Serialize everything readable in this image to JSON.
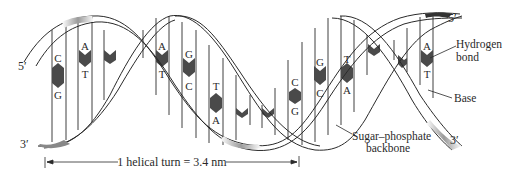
{
  "diagram": {
    "type": "DNA double helix",
    "strand_ends": {
      "top_left": "5′",
      "bottom_left": "3′",
      "top_right": "5′",
      "bottom_right": "3′"
    },
    "base_pairs": [
      {
        "top": "C",
        "bottom": "G",
        "x": 56
      },
      {
        "top": "A",
        "bottom": "T",
        "x": 85
      },
      {
        "top": "A",
        "bottom": "T",
        "x": 162
      },
      {
        "top": "G",
        "bottom": "C",
        "x": 189
      },
      {
        "top": "T",
        "bottom": "A",
        "x": 216
      },
      {
        "top": "C",
        "bottom": "G",
        "x": 295
      },
      {
        "top": "G",
        "bottom": "C",
        "x": 320
      },
      {
        "top": "T",
        "bottom": "A",
        "x": 347
      },
      {
        "top": "A",
        "bottom": "T",
        "x": 427
      }
    ],
    "callouts": {
      "hydrogen_bond": [
        "Hydrogen",
        "bond"
      ],
      "base": "Base",
      "backbone": [
        "Sugar–phosphate",
        "backbone"
      ]
    },
    "measurement": {
      "label": "1 helical turn = 3.4 nm"
    },
    "colors": {
      "ink": "#2a2a2a",
      "hbond_fill": "#4a4a4a",
      "ribbon_shade": "#bdbdbd",
      "background": "#ffffff"
    }
  }
}
